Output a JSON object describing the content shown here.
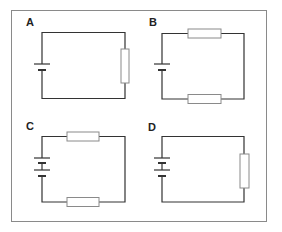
{
  "figure": {
    "border_color": "#8a8a8a",
    "wire_color": "#333333",
    "resistor_fill": "#ffffff",
    "resistor_stroke": "#8a8a8a",
    "panels": [
      {
        "id": "A",
        "label": "A",
        "cells": 1,
        "resistors": [
          "right"
        ]
      },
      {
        "id": "B",
        "label": "B",
        "cells": 1,
        "resistors": [
          "top",
          "bottom"
        ]
      },
      {
        "id": "C",
        "label": "C",
        "cells": 2,
        "resistors": [
          "top",
          "bottom"
        ]
      },
      {
        "id": "D",
        "label": "D",
        "cells": 2,
        "resistors": [
          "right"
        ]
      }
    ]
  }
}
